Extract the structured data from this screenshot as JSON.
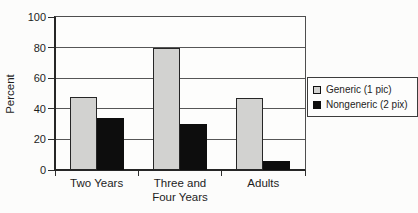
{
  "chart_data": {
    "type": "bar",
    "title": "",
    "ylabel": "Percent",
    "xlabel": "",
    "ylim": [
      0,
      100
    ],
    "yticks": [
      0,
      20,
      40,
      60,
      80,
      100
    ],
    "grid": true,
    "legend_position": "right",
    "categories": [
      "Two Years",
      "Three and\nFour Years",
      "Adults"
    ],
    "series": [
      {
        "name": "Generic (1 pic)",
        "color": "#d2d2d0",
        "border_color": "#262626",
        "values": [
          48,
          80,
          47
        ]
      },
      {
        "name": "Nongeneric (2 pix)",
        "color": "#0d0d0d",
        "border_color": "#0d0d0d",
        "values": [
          34,
          30,
          6
        ]
      }
    ],
    "colors": {
      "gridline": "#565656",
      "axis": "#262626",
      "background": "#fcfcfb"
    }
  }
}
